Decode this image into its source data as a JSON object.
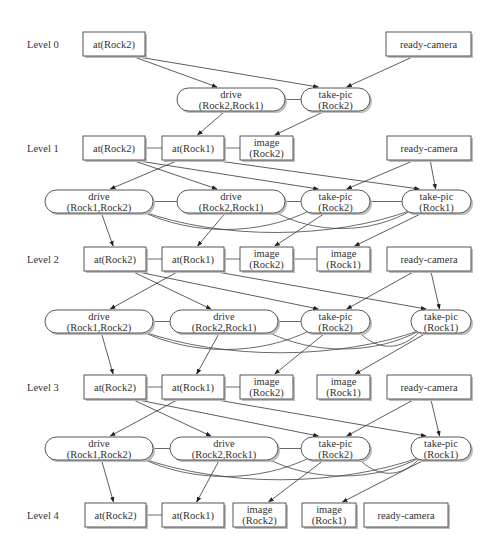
{
  "levels": [
    {
      "label": "Level 0"
    },
    {
      "label": "Level 1"
    },
    {
      "label": "Level 2"
    },
    {
      "label": "Level 3"
    },
    {
      "label": "Level 4"
    }
  ],
  "nodes": [
    {
      "id": "L0_atR2",
      "kind": "proposition",
      "lines": [
        "at(Rock2)"
      ]
    },
    {
      "id": "L0_ready",
      "kind": "proposition",
      "lines": [
        "ready-camera"
      ]
    },
    {
      "id": "A0_driveR2R1",
      "kind": "action",
      "lines": [
        "drive",
        "(Rock2,Rock1)"
      ]
    },
    {
      "id": "A0_tpR2",
      "kind": "action",
      "lines": [
        "take-pic",
        "(Rock2)"
      ]
    },
    {
      "id": "L1_atR2",
      "kind": "proposition",
      "lines": [
        "at(Rock2)"
      ]
    },
    {
      "id": "L1_atR1",
      "kind": "proposition",
      "lines": [
        "at(Rock1)"
      ]
    },
    {
      "id": "L1_imgR2",
      "kind": "proposition",
      "lines": [
        "image",
        "(Rock2)"
      ]
    },
    {
      "id": "L1_ready",
      "kind": "proposition",
      "lines": [
        "ready-camera"
      ]
    },
    {
      "id": "A1_driveR1R2",
      "kind": "action",
      "lines": [
        "drive",
        "(Rock1,Rock2)"
      ]
    },
    {
      "id": "A1_driveR2R1",
      "kind": "action",
      "lines": [
        "drive",
        "(Rock2,Rock1)"
      ]
    },
    {
      "id": "A1_tpR2",
      "kind": "action",
      "lines": [
        "take-pic",
        "(Rock2)"
      ]
    },
    {
      "id": "A1_tpR1",
      "kind": "action",
      "lines": [
        "take-pic",
        "(Rock1)"
      ]
    },
    {
      "id": "L2_atR2",
      "kind": "proposition",
      "lines": [
        "at(Rock2)"
      ]
    },
    {
      "id": "L2_atR1",
      "kind": "proposition",
      "lines": [
        "at(Rock1)"
      ]
    },
    {
      "id": "L2_imgR2",
      "kind": "proposition",
      "lines": [
        "image",
        "(Rock2)"
      ]
    },
    {
      "id": "L2_imgR1",
      "kind": "proposition",
      "lines": [
        "image",
        "(Rock1)"
      ]
    },
    {
      "id": "L2_ready",
      "kind": "proposition",
      "lines": [
        "ready-camera"
      ]
    },
    {
      "id": "A2_driveR1R2",
      "kind": "action",
      "lines": [
        "drive",
        "(Rock1,Rock2)"
      ]
    },
    {
      "id": "A2_driveR2R1",
      "kind": "action",
      "lines": [
        "drive",
        "(Rock2,Rock1)"
      ]
    },
    {
      "id": "A2_tpR2",
      "kind": "action",
      "lines": [
        "take-pic",
        "(Rock2)"
      ]
    },
    {
      "id": "A2_tpR1",
      "kind": "action",
      "lines": [
        "take-pic",
        "(Rock1)"
      ]
    },
    {
      "id": "L3_atR2",
      "kind": "proposition",
      "lines": [
        "at(Rock2)"
      ]
    },
    {
      "id": "L3_atR1",
      "kind": "proposition",
      "lines": [
        "at(Rock1)"
      ]
    },
    {
      "id": "L3_imgR2",
      "kind": "proposition",
      "lines": [
        "image",
        "(Rock2)"
      ]
    },
    {
      "id": "L3_imgR1",
      "kind": "proposition",
      "lines": [
        "image",
        "(Rock1)"
      ]
    },
    {
      "id": "L3_ready",
      "kind": "proposition",
      "lines": [
        "ready-camera"
      ]
    },
    {
      "id": "A3_driveR1R2",
      "kind": "action",
      "lines": [
        "drive",
        "(Rock1,Rock2)"
      ]
    },
    {
      "id": "A3_driveR2R1",
      "kind": "action",
      "lines": [
        "drive",
        "(Rock2,Rock1)"
      ]
    },
    {
      "id": "A3_tpR2",
      "kind": "action",
      "lines": [
        "take-pic",
        "(Rock2)"
      ]
    },
    {
      "id": "A3_tpR1",
      "kind": "action",
      "lines": [
        "take-pic",
        "(Rock1)"
      ]
    },
    {
      "id": "L4_atR2",
      "kind": "proposition",
      "lines": [
        "at(Rock2)"
      ]
    },
    {
      "id": "L4_atR1",
      "kind": "proposition",
      "lines": [
        "at(Rock1)"
      ]
    },
    {
      "id": "L4_imgR2",
      "kind": "proposition",
      "lines": [
        "image",
        "(Rock2)"
      ]
    },
    {
      "id": "L4_imgR1",
      "kind": "proposition",
      "lines": [
        "image",
        "(Rock1)"
      ]
    },
    {
      "id": "L4_ready",
      "kind": "proposition",
      "lines": [
        "ready-camera"
      ]
    }
  ],
  "edges": [
    {
      "from": "L0_atR2",
      "to": "A0_driveR2R1",
      "type": "precondition"
    },
    {
      "from": "L0_atR2",
      "to": "A0_tpR2",
      "type": "precondition"
    },
    {
      "from": "L0_ready",
      "to": "A0_tpR2",
      "type": "precondition"
    },
    {
      "from": "A0_driveR2R1",
      "to": "L1_atR1",
      "type": "effect"
    },
    {
      "from": "A0_tpR2",
      "to": "L1_imgR2",
      "type": "effect"
    },
    {
      "from": "L1_atR1",
      "to": "A1_driveR1R2",
      "type": "precondition"
    },
    {
      "from": "L1_atR2",
      "to": "A1_driveR2R1",
      "type": "precondition"
    },
    {
      "from": "L1_atR2",
      "to": "A1_tpR2",
      "type": "precondition"
    },
    {
      "from": "L1_atR1",
      "to": "A1_tpR1",
      "type": "precondition"
    },
    {
      "from": "L1_ready",
      "to": "A1_tpR2",
      "type": "precondition"
    },
    {
      "from": "L1_ready",
      "to": "A1_tpR1",
      "type": "precondition"
    },
    {
      "from": "A1_driveR1R2",
      "to": "L2_atR2",
      "type": "effect"
    },
    {
      "from": "A1_driveR2R1",
      "to": "L2_atR1",
      "type": "effect"
    },
    {
      "from": "A1_tpR2",
      "to": "L2_imgR2",
      "type": "effect"
    },
    {
      "from": "A1_tpR1",
      "to": "L2_imgR1",
      "type": "effect"
    },
    {
      "from": "L2_atR1",
      "to": "A2_driveR1R2",
      "type": "precondition"
    },
    {
      "from": "L2_atR2",
      "to": "A2_driveR2R1",
      "type": "precondition"
    },
    {
      "from": "L2_atR2",
      "to": "A2_tpR2",
      "type": "precondition"
    },
    {
      "from": "L2_atR1",
      "to": "A2_tpR1",
      "type": "precondition"
    },
    {
      "from": "L2_ready",
      "to": "A2_tpR2",
      "type": "precondition"
    },
    {
      "from": "L2_ready",
      "to": "A2_tpR1",
      "type": "precondition"
    },
    {
      "from": "A2_driveR1R2",
      "to": "L3_atR2",
      "type": "effect"
    },
    {
      "from": "A2_driveR2R1",
      "to": "L3_atR1",
      "type": "effect"
    },
    {
      "from": "A2_tpR2",
      "to": "L3_imgR2",
      "type": "effect"
    },
    {
      "from": "A2_tpR1",
      "to": "L3_imgR1",
      "type": "effect"
    },
    {
      "from": "L3_atR1",
      "to": "A3_driveR1R2",
      "type": "precondition"
    },
    {
      "from": "L3_atR2",
      "to": "A3_driveR2R1",
      "type": "precondition"
    },
    {
      "from": "L3_atR2",
      "to": "A3_tpR2",
      "type": "precondition"
    },
    {
      "from": "L3_atR1",
      "to": "A3_tpR1",
      "type": "precondition"
    },
    {
      "from": "L3_ready",
      "to": "A3_tpR2",
      "type": "precondition"
    },
    {
      "from": "L3_ready",
      "to": "A3_tpR1",
      "type": "precondition"
    },
    {
      "from": "A3_driveR1R2",
      "to": "L4_atR2",
      "type": "effect"
    },
    {
      "from": "A3_driveR2R1",
      "to": "L4_atR1",
      "type": "effect"
    },
    {
      "from": "A3_tpR2",
      "to": "L4_imgR2",
      "type": "effect"
    },
    {
      "from": "A3_tpR1",
      "to": "L4_imgR1",
      "type": "effect"
    }
  ],
  "mutex": [
    {
      "a": "A0_driveR2R1",
      "b": "A0_tpR2"
    },
    {
      "a": "L1_atR2",
      "b": "L1_atR1"
    },
    {
      "a": "L1_atR1",
      "b": "L1_imgR2"
    },
    {
      "a": "A1_driveR1R2",
      "b": "A1_driveR2R1"
    },
    {
      "a": "A1_driveR2R1",
      "b": "A1_tpR2"
    },
    {
      "a": "A1_tpR2",
      "b": "A1_tpR1"
    },
    {
      "a": "A1_driveR1R2",
      "b": "A1_tpR2"
    },
    {
      "a": "A1_driveR1R2",
      "b": "A1_tpR1"
    },
    {
      "a": "A1_driveR2R1",
      "b": "A1_tpR1"
    },
    {
      "a": "L2_atR2",
      "b": "L2_atR1"
    },
    {
      "a": "L2_atR1",
      "b": "L2_imgR2"
    },
    {
      "a": "L2_imgR2",
      "b": "L2_imgR1"
    },
    {
      "a": "A2_driveR1R2",
      "b": "A2_driveR2R1"
    },
    {
      "a": "A2_driveR2R1",
      "b": "A2_tpR2"
    },
    {
      "a": "A2_tpR2",
      "b": "A2_tpR1"
    },
    {
      "a": "A2_driveR1R2",
      "b": "A2_tpR2"
    },
    {
      "a": "A2_driveR1R2",
      "b": "A2_tpR1"
    },
    {
      "a": "A2_driveR2R1",
      "b": "A2_tpR1"
    },
    {
      "a": "L3_atR2",
      "b": "L3_atR1"
    },
    {
      "a": "L3_atR1",
      "b": "L3_imgR2"
    },
    {
      "a": "A3_driveR1R2",
      "b": "A3_driveR2R1"
    },
    {
      "a": "A3_driveR2R1",
      "b": "A3_tpR2"
    },
    {
      "a": "A3_tpR2",
      "b": "A3_tpR1"
    },
    {
      "a": "A3_driveR1R2",
      "b": "A3_tpR2"
    },
    {
      "a": "A3_driveR1R2",
      "b": "A3_tpR1"
    },
    {
      "a": "A3_driveR2R1",
      "b": "A3_tpR1"
    },
    {
      "a": "L4_atR2",
      "b": "L4_atR1"
    }
  ]
}
